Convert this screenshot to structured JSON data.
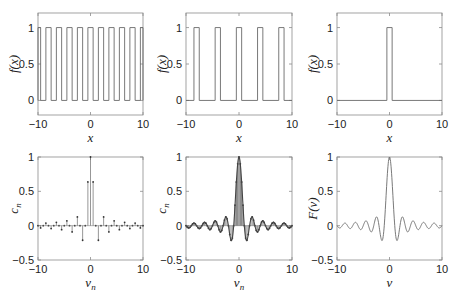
{
  "figure": {
    "width": 454,
    "height": 296,
    "line_color": "#6a6a6a",
    "axis_color": "#8c8c8c",
    "bar_fill": "#bdbdbd"
  },
  "chart_data": [
    {
      "id": "p1",
      "type": "line",
      "title": "",
      "xlabel": "x",
      "ylabel": "f(x)",
      "xlim": [
        -10,
        10
      ],
      "ylim": [
        -0.2,
        1.2
      ],
      "xticks": [
        -10,
        0,
        10
      ],
      "yticks": [
        0,
        0.5,
        1
      ],
      "xtick_labels": [
        "−10",
        "0",
        "10"
      ],
      "ytick_labels": [
        "0",
        "0.5",
        "1"
      ],
      "grid": false,
      "description": "periodic rectangular pulse train, width 1, period 2",
      "pulse_width": 1,
      "period": 2
    },
    {
      "id": "p2",
      "type": "line",
      "title": "",
      "xlabel": "x",
      "ylabel": "f(x)",
      "xlim": [
        -10,
        10
      ],
      "ylim": [
        -0.2,
        1.2
      ],
      "xticks": [
        -10,
        0,
        10
      ],
      "yticks": [
        0,
        0.5,
        1
      ],
      "xtick_labels": [
        "−10",
        "0",
        "10"
      ],
      "ytick_labels": [
        "0",
        "0.5",
        "1"
      ],
      "grid": false,
      "description": "periodic rectangular pulse train, width 1, period 4",
      "pulse_width": 1,
      "period": 4
    },
    {
      "id": "p3",
      "type": "line",
      "title": "",
      "xlabel": "x",
      "ylabel": "f(x)",
      "xlim": [
        -10,
        10
      ],
      "ylim": [
        -0.2,
        1.2
      ],
      "xticks": [
        -10,
        0,
        10
      ],
      "yticks": [
        0,
        0.5,
        1
      ],
      "xtick_labels": [
        "−10",
        "0",
        "10"
      ],
      "ytick_labels": [
        "0",
        "0.5",
        "1"
      ],
      "grid": false,
      "description": "single rectangular pulse on [-0.5, 0.5]",
      "pulse_width": 1,
      "period": null
    },
    {
      "id": "p4",
      "type": "stem",
      "title": "",
      "xlabel": "ν_n",
      "ylabel": "c_n",
      "xlim": [
        -10,
        10
      ],
      "ylim": [
        -0.5,
        1
      ],
      "xticks": [
        -10,
        0,
        10
      ],
      "yticks": [
        -0.5,
        0,
        0.5,
        1
      ],
      "xtick_labels": [
        "−10",
        "0",
        "10"
      ],
      "ytick_labels": [
        "−0.5",
        "0",
        "0.5",
        "1"
      ],
      "grid": false,
      "description": "normalized Fourier coefficients c_n = sinc(ν_n), ν_n = n/2",
      "spacing": 0.5,
      "sample_points": [
        [
          0,
          1.0
        ],
        [
          0.5,
          0.637
        ],
        [
          1,
          0
        ],
        [
          1.5,
          -0.212
        ],
        [
          2,
          0
        ],
        [
          2.5,
          0.127
        ],
        [
          3.5,
          -0.091
        ],
        [
          4.5,
          0.071
        ],
        [
          5.5,
          -0.058
        ],
        [
          6.5,
          0.049
        ],
        [
          7.5,
          -0.042
        ],
        [
          8.5,
          0.037
        ],
        [
          9.5,
          -0.034
        ]
      ]
    },
    {
      "id": "p5",
      "type": "stem",
      "title": "",
      "xlabel": "ν_n",
      "ylabel": "c_n",
      "xlim": [
        -10,
        10
      ],
      "ylim": [
        -0.5,
        1
      ],
      "xticks": [
        -10,
        0,
        10
      ],
      "yticks": [
        -0.5,
        0,
        0.5,
        1
      ],
      "xtick_labels": [
        "−10",
        "0",
        "10"
      ],
      "ytick_labels": [
        "−0.5",
        "0",
        "0.5",
        "1"
      ],
      "grid": false,
      "description": "normalized Fourier coefficients c_n = sinc(ν_n), ν_n = n/4 (denser sampling)",
      "spacing": 0.25,
      "sample_points": [
        [
          0,
          1.0
        ],
        [
          0.25,
          0.9
        ],
        [
          0.5,
          0.637
        ],
        [
          0.75,
          0.3
        ],
        [
          1,
          0
        ],
        [
          1.25,
          -0.18
        ],
        [
          1.5,
          -0.212
        ],
        [
          1.75,
          -0.129
        ],
        [
          2,
          0
        ],
        [
          2.5,
          0.127
        ],
        [
          3.5,
          -0.091
        ]
      ]
    },
    {
      "id": "p6",
      "type": "line",
      "title": "",
      "xlabel": "ν",
      "ylabel": "F(ν)",
      "xlim": [
        -10,
        10
      ],
      "ylim": [
        -0.5,
        1
      ],
      "xticks": [
        -10,
        0,
        10
      ],
      "yticks": [
        -0.5,
        0,
        0.5,
        1
      ],
      "xtick_labels": [
        "−10",
        "0",
        "10"
      ],
      "ytick_labels": [
        "−0.5",
        "0",
        "0.5",
        "1"
      ],
      "grid": false,
      "description": "continuous Fourier transform F(ν) = sinc(ν) = sin(πν)/(πν)",
      "sample_points": [
        [
          0,
          1.0
        ],
        [
          0.5,
          0.637
        ],
        [
          1,
          0
        ],
        [
          1.5,
          -0.212
        ],
        [
          2,
          0
        ],
        [
          2.5,
          0.127
        ],
        [
          3.5,
          -0.091
        ],
        [
          4.5,
          0.071
        ],
        [
          5.5,
          -0.058
        ],
        [
          10,
          0
        ]
      ]
    }
  ],
  "axes_labels": {
    "p1": {
      "y": "f(x)",
      "x": "x"
    },
    "p2": {
      "y": "f(x)",
      "x": "x"
    },
    "p3": {
      "y": "f(x)",
      "x": "x"
    },
    "p4": {
      "y": "c",
      "y_sub": "n",
      "x": "ν",
      "x_sub": "n"
    },
    "p5": {
      "y": "c",
      "y_sub": "n",
      "x": "ν",
      "x_sub": "n"
    },
    "p6": {
      "y": "F(ν)",
      "x": "ν"
    }
  }
}
